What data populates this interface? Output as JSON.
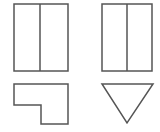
{
  "diagram": {
    "title": "",
    "stroke_color": "#555555",
    "background": "#ffffff",
    "views": [
      {
        "name": "front-view",
        "shape": "rectangle-split-vertical",
        "x": 14,
        "y": 4,
        "w": 54,
        "h": 67,
        "divider_x": 40
      },
      {
        "name": "side-view",
        "shape": "rectangle-split-vertical",
        "x": 102,
        "y": 4,
        "w": 50,
        "h": 67,
        "divider_x": 127
      },
      {
        "name": "top-view",
        "shape": "l-shape",
        "points": "14,84 68,84 68,124 41,124 41,105 14,105"
      },
      {
        "name": "triangle-view",
        "shape": "inverted-triangle",
        "points": "102,84 153,84 127,123"
      }
    ]
  }
}
